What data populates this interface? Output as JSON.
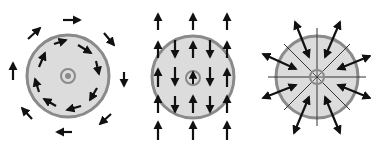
{
  "diagram": {
    "colors": {
      "background": "#ffffff",
      "disc_fill": "#dcdcdc",
      "disc_ring": "#8a8a8a",
      "arrow": "#111111",
      "line": "#333333"
    },
    "panels": [
      {
        "id": "vortex",
        "label": "circulating-field",
        "center": [
          68,
          76
        ],
        "radius": 42,
        "center_marker": "concentric-dot",
        "pattern": "clockwise circulation (inner and outer rings)"
      },
      {
        "id": "uniform",
        "label": "uniform-field-with-opposing-inner",
        "center": [
          193,
          77
        ],
        "radius": 42,
        "center_marker": "circle-with-up-arrow",
        "pattern": "outer columns point up, inner alternating columns point down"
      },
      {
        "id": "radial",
        "label": "radial-field",
        "center": [
          317,
          77
        ],
        "radius": 42,
        "center_marker": "spoked-wheel",
        "pattern": "8 radial spokes with double-headed arrows between them"
      }
    ]
  }
}
